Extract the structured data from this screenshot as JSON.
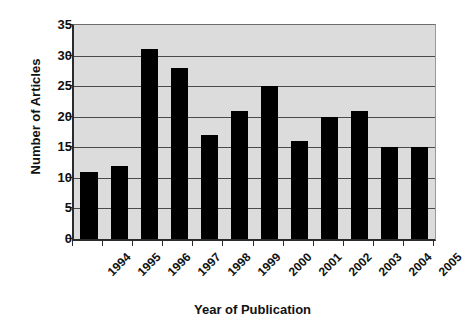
{
  "chart_data": {
    "type": "bar",
    "title": "",
    "xlabel": "Year of Publication",
    "ylabel": "Number of Articles",
    "categories": [
      "1994",
      "1995",
      "1996",
      "1997",
      "1998",
      "1999",
      "2000",
      "2001",
      "2002",
      "2003",
      "2004",
      "2005"
    ],
    "values": [
      11,
      12,
      31,
      28,
      17,
      21,
      25,
      16,
      20,
      21,
      15,
      15
    ],
    "ylim": [
      0,
      35
    ],
    "ytick_labels": [
      "0",
      "5",
      "10",
      "15",
      "20",
      "25",
      "30",
      "35"
    ],
    "ytick_values": [
      0,
      5,
      10,
      15,
      20,
      25,
      30,
      35
    ],
    "grid": true,
    "grid_axis": "y",
    "legend": false,
    "legend_position": "none",
    "series_name": "Number of Articles",
    "colors": {
      "bar": "#000000",
      "plot_background": "#dcdcdc",
      "gridline": "#4a4a4a",
      "axis": "#2b2b2b",
      "text": "#111111",
      "figure_background": "#ffffff"
    }
  }
}
